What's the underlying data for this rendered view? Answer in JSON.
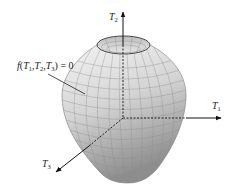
{
  "figure": {
    "surface_label": {
      "func": "f",
      "open": "(",
      "args": [
        {
          "var": "T",
          "sub": "1"
        },
        {
          "var": "T",
          "sub": "2"
        },
        {
          "var": "T",
          "sub": "3"
        }
      ],
      "close": ")",
      "equals": " = 0"
    },
    "axes": [
      {
        "name": "T",
        "sub": "1",
        "direction": "right"
      },
      {
        "name": "T",
        "sub": "2",
        "direction": "up"
      },
      {
        "name": "T",
        "sub": "3",
        "direction": "down-left"
      }
    ],
    "colors": {
      "surface_light": "#f2f2f2",
      "surface_dark": "#9a9a9a",
      "mesh": "#8a8a8a",
      "axis": "#111111"
    }
  }
}
